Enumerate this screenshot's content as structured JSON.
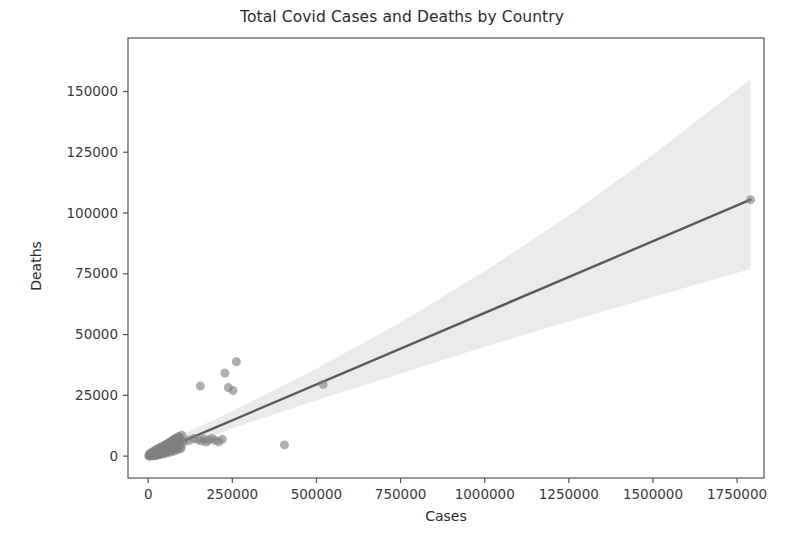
{
  "chart_data": {
    "type": "scatter",
    "title": "Total Covid Cases and Deaths by Country",
    "xlabel": "Cases",
    "ylabel": "Deaths",
    "xlim": [
      -60000,
      1830000
    ],
    "ylim": [
      -9000,
      172000
    ],
    "xticks": [
      0,
      250000,
      500000,
      750000,
      1000000,
      1250000,
      1500000,
      1750000
    ],
    "xticklabels": [
      "0",
      "250000",
      "500000",
      "750000",
      "1000000",
      "1250000",
      "1500000",
      "1750000"
    ],
    "yticks": [
      0,
      25000,
      50000,
      75000,
      100000,
      125000,
      150000
    ],
    "yticklabels": [
      "0",
      "25000",
      "50000",
      "75000",
      "100000",
      "125000",
      "150000"
    ],
    "grid": false,
    "legend": null,
    "marker_color": "#7f7f7f",
    "marker_opacity": 0.62,
    "marker_size": 9,
    "line_color": "#5a5a5a",
    "band_color": "#e8e8e8",
    "regression": {
      "x_start": 0,
      "y_start": 0,
      "x_end": 1790000,
      "y_end": 105500,
      "slope": 0.0589,
      "intercept": 0
    },
    "confidence_band": {
      "x": [
        0,
        250000,
        500000,
        750000,
        1000000,
        1250000,
        1500000,
        1790000
      ],
      "upper": [
        2500,
        18500,
        36000,
        55000,
        76000,
        99000,
        124000,
        155000
      ],
      "lower": [
        -2500,
        11500,
        23000,
        34000,
        45000,
        55500,
        65500,
        77000
      ]
    },
    "points": [
      {
        "x": 5000,
        "y": 300
      },
      {
        "x": 9000,
        "y": 500
      },
      {
        "x": 12000,
        "y": 800
      },
      {
        "x": 15000,
        "y": 400
      },
      {
        "x": 18000,
        "y": 1100
      },
      {
        "x": 21000,
        "y": 700
      },
      {
        "x": 24000,
        "y": 1500
      },
      {
        "x": 27000,
        "y": 600
      },
      {
        "x": 30000,
        "y": 1900
      },
      {
        "x": 33000,
        "y": 1000
      },
      {
        "x": 36000,
        "y": 2400
      },
      {
        "x": 39000,
        "y": 1300
      },
      {
        "x": 42000,
        "y": 3000
      },
      {
        "x": 45000,
        "y": 1700
      },
      {
        "x": 48000,
        "y": 3600
      },
      {
        "x": 52000,
        "y": 2100
      },
      {
        "x": 55000,
        "y": 4300
      },
      {
        "x": 58000,
        "y": 2600
      },
      {
        "x": 62000,
        "y": 5200
      },
      {
        "x": 65000,
        "y": 3100
      },
      {
        "x": 68000,
        "y": 6000
      },
      {
        "x": 72000,
        "y": 3600
      },
      {
        "x": 75000,
        "y": 6800
      },
      {
        "x": 79000,
        "y": 4200
      },
      {
        "x": 82000,
        "y": 7400
      },
      {
        "x": 86000,
        "y": 4800
      },
      {
        "x": 90000,
        "y": 8100
      },
      {
        "x": 95000,
        "y": 5400
      },
      {
        "x": 100000,
        "y": 8600
      },
      {
        "x": 105000,
        "y": 6000
      },
      {
        "x": 3000,
        "y": 150
      },
      {
        "x": 6000,
        "y": 250
      },
      {
        "x": 8000,
        "y": 1200
      },
      {
        "x": 11000,
        "y": 200
      },
      {
        "x": 14000,
        "y": 1600
      },
      {
        "x": 17000,
        "y": 350
      },
      {
        "x": 20000,
        "y": 2200
      },
      {
        "x": 23000,
        "y": 450
      },
      {
        "x": 26000,
        "y": 2800
      },
      {
        "x": 29000,
        "y": 550
      },
      {
        "x": 34000,
        "y": 3400
      },
      {
        "x": 38000,
        "y": 900
      },
      {
        "x": 43000,
        "y": 4100
      },
      {
        "x": 47000,
        "y": 1400
      },
      {
        "x": 53000,
        "y": 4900
      },
      {
        "x": 57000,
        "y": 1800
      },
      {
        "x": 63000,
        "y": 5600
      },
      {
        "x": 67000,
        "y": 2300
      },
      {
        "x": 73000,
        "y": 6400
      },
      {
        "x": 77000,
        "y": 2900
      },
      {
        "x": 84000,
        "y": 7100
      },
      {
        "x": 88000,
        "y": 3300
      },
      {
        "x": 93000,
        "y": 7800
      },
      {
        "x": 98000,
        "y": 3900
      },
      {
        "x": 2000,
        "y": 80
      },
      {
        "x": 4000,
        "y": 1000
      },
      {
        "x": 7000,
        "y": 120
      },
      {
        "x": 10000,
        "y": 1400
      },
      {
        "x": 13000,
        "y": 180
      },
      {
        "x": 16000,
        "y": 1900
      },
      {
        "x": 19000,
        "y": 260
      },
      {
        "x": 22000,
        "y": 2500
      },
      {
        "x": 25000,
        "y": 320
      },
      {
        "x": 31000,
        "y": 3200
      },
      {
        "x": 35000,
        "y": 650
      },
      {
        "x": 41000,
        "y": 3800
      },
      {
        "x": 46000,
        "y": 950
      },
      {
        "x": 51000,
        "y": 4600
      },
      {
        "x": 56000,
        "y": 1250
      },
      {
        "x": 61000,
        "y": 5300
      },
      {
        "x": 66000,
        "y": 1650
      },
      {
        "x": 71000,
        "y": 6100
      },
      {
        "x": 76000,
        "y": 2050
      },
      {
        "x": 81000,
        "y": 6900
      },
      {
        "x": 87000,
        "y": 2550
      },
      {
        "x": 92000,
        "y": 7600
      },
      {
        "x": 97000,
        "y": 3050
      },
      {
        "x": 120000,
        "y": 6500
      },
      {
        "x": 135000,
        "y": 7200
      },
      {
        "x": 148000,
        "y": 6800
      },
      {
        "x": 158000,
        "y": 6200
      },
      {
        "x": 165000,
        "y": 7000
      },
      {
        "x": 172000,
        "y": 5800
      },
      {
        "x": 180000,
        "y": 6600
      },
      {
        "x": 190000,
        "y": 7300
      },
      {
        "x": 200000,
        "y": 6400
      },
      {
        "x": 210000,
        "y": 5900
      },
      {
        "x": 220000,
        "y": 6900
      },
      {
        "x": 155000,
        "y": 28800
      },
      {
        "x": 228000,
        "y": 34200
      },
      {
        "x": 238000,
        "y": 28200
      },
      {
        "x": 262000,
        "y": 38800
      },
      {
        "x": 252000,
        "y": 27000
      },
      {
        "x": 405000,
        "y": 4600
      },
      {
        "x": 520000,
        "y": 29500
      },
      {
        "x": 1790000,
        "y": 105500
      }
    ]
  }
}
